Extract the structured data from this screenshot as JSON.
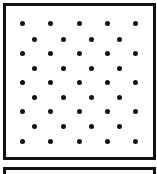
{
  "diagram": {
    "type": "dot-lattice",
    "frames": [
      {
        "name": "dot-panel",
        "x": 3,
        "y": 3,
        "width": 153,
        "height": 157
      },
      {
        "name": "second-panel",
        "x": 3,
        "y": 167,
        "width": 153,
        "height": 12
      }
    ],
    "dot_color": "#111111",
    "border_color": "#111111",
    "rows": [
      {
        "y": 23,
        "xs": [
          22,
          50,
          79,
          107,
          135
        ]
      },
      {
        "y": 39,
        "xs": [
          34,
          63,
          91,
          119
        ]
      },
      {
        "y": 53,
        "xs": [
          22,
          50,
          79,
          107,
          135
        ]
      },
      {
        "y": 68,
        "xs": [
          34,
          63,
          91,
          119
        ]
      },
      {
        "y": 82,
        "xs": [
          22,
          50,
          79,
          107,
          135
        ]
      },
      {
        "y": 97,
        "xs": [
          34,
          63,
          91,
          119
        ]
      },
      {
        "y": 111,
        "xs": [
          22,
          50,
          79,
          107,
          135
        ]
      },
      {
        "y": 126,
        "xs": [
          34,
          63,
          91,
          119
        ]
      },
      {
        "y": 141,
        "xs": [
          22,
          50,
          79,
          107,
          135
        ]
      }
    ]
  }
}
